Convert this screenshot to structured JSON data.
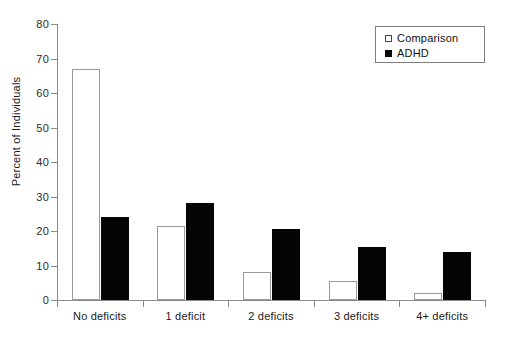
{
  "chart_data": {
    "type": "bar",
    "title": "",
    "xlabel": "",
    "ylabel": "Percent of Individuals",
    "categories": [
      "No deficits",
      "1 deficit",
      "2 deficits",
      "3 deficits",
      "4+ deficits"
    ],
    "series": [
      {
        "name": "Comparison",
        "values": [
          67,
          21.5,
          8,
          5.5,
          2
        ],
        "color": "#ffffff",
        "edge_color": "#9a9a9a"
      },
      {
        "name": "ADHD",
        "values": [
          24,
          28,
          20.5,
          15.5,
          14
        ],
        "color": "#050505",
        "edge_color": "#050505"
      }
    ],
    "ylim": [
      0,
      80
    ],
    "yticks": [
      0,
      10,
      20,
      30,
      40,
      50,
      60,
      70,
      80
    ],
    "ytick_labels": [
      "0",
      "10",
      "20",
      "30",
      "40",
      "50",
      "60",
      "70",
      "80"
    ],
    "grid": false,
    "legend_position": "top-right",
    "legend_entries": [
      "Comparison",
      "ADHD"
    ]
  },
  "legend": {
    "items": [
      {
        "label": "Comparison",
        "marker": "open-square-marker"
      },
      {
        "label": "ADHD",
        "marker": "filled-square-marker"
      }
    ]
  }
}
